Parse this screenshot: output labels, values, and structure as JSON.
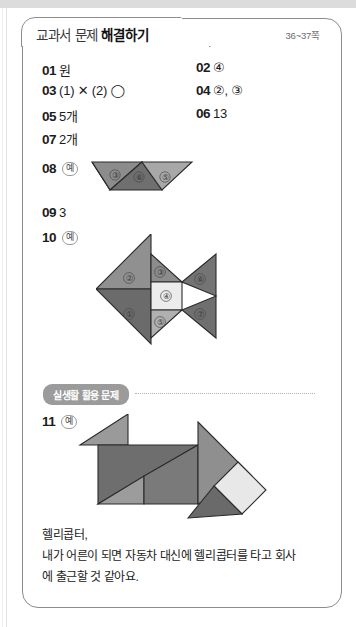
{
  "header": {
    "tab_title_part1": "교과서 문제",
    "tab_title_part2": "해결하기",
    "page_range": "36~37쪽"
  },
  "answers": [
    {
      "num": "01",
      "value": "원"
    },
    {
      "num": "02",
      "value": "④"
    },
    {
      "num": "03",
      "value": "(1) ✕  (2) ◯"
    },
    {
      "num": "04",
      "value": "②, ③"
    },
    {
      "num": "05",
      "value": "5개"
    },
    {
      "num": "06",
      "value": "13"
    },
    {
      "num": "07",
      "value": "2개"
    },
    {
      "num": "08",
      "value": "예"
    },
    {
      "num": "09",
      "value": "3"
    },
    {
      "num": "10",
      "value": "예"
    },
    {
      "num": "11",
      "value": "예"
    }
  ],
  "example_badge": "예",
  "section": {
    "label": "실생활 활용 문제"
  },
  "tangram_08": {
    "type": "parallelogram",
    "pieces": [
      {
        "id": "③",
        "color": "#8c8c8c"
      },
      {
        "id": "⑥",
        "color": "#6f6f6f"
      },
      {
        "id": "⑤",
        "color": "#a8a8a8"
      }
    ]
  },
  "tangram_10": {
    "type": "fish",
    "pieces": [
      {
        "id": "①",
        "color": "#6b6b6b"
      },
      {
        "id": "②",
        "color": "#909090"
      },
      {
        "id": "③",
        "color": "#8c8c8c"
      },
      {
        "id": "④",
        "color": "#ececec"
      },
      {
        "id": "⑤",
        "color": "#b0b0b0"
      },
      {
        "id": "⑥",
        "color": "#747474"
      },
      {
        "id": "⑦",
        "color": "#6f6f6f"
      }
    ]
  },
  "tangram_11": {
    "type": "helicopter",
    "pieces": [
      {
        "id": "rotor-blade",
        "color": "#9a9a9a"
      },
      {
        "id": "body-large-triangle",
        "color": "#6e6e6e"
      },
      {
        "id": "body-mid-triangle",
        "color": "#7a7a7a"
      },
      {
        "id": "small-triangle",
        "color": "#9c9c9c"
      },
      {
        "id": "nose-triangle",
        "color": "#8f8f8f"
      },
      {
        "id": "window-square",
        "color": "#e8e8e8"
      },
      {
        "id": "skid-triangle",
        "color": "#6a6a6a"
      }
    ]
  },
  "answer_text": {
    "line1": "헬리콥터,",
    "line2": "내가 어른이 되면 자동차 대신에 헬리콥터를 타고 회사",
    "line3": "에 출근할 것 같아요."
  }
}
